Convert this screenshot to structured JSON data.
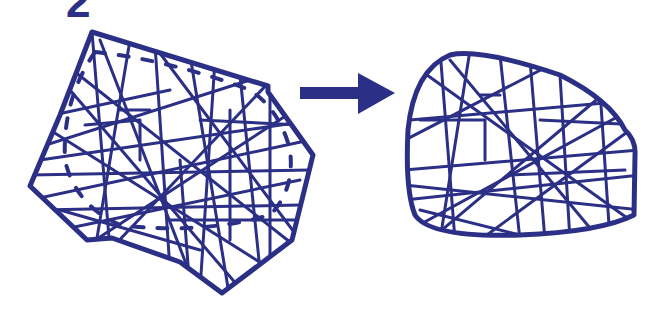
{
  "figure": {
    "label": "2",
    "ink_color": "#2b2f86",
    "background": "#ffffff",
    "left_panel": {
      "description": "irregular polygon with criss-crossing fibers and dashed inner boundary",
      "outline": "solid",
      "inner_boundary": "dashed"
    },
    "arrow": {
      "direction": "right"
    },
    "right_panel": {
      "description": "rounded shape with criss-crossing fibers"
    }
  }
}
